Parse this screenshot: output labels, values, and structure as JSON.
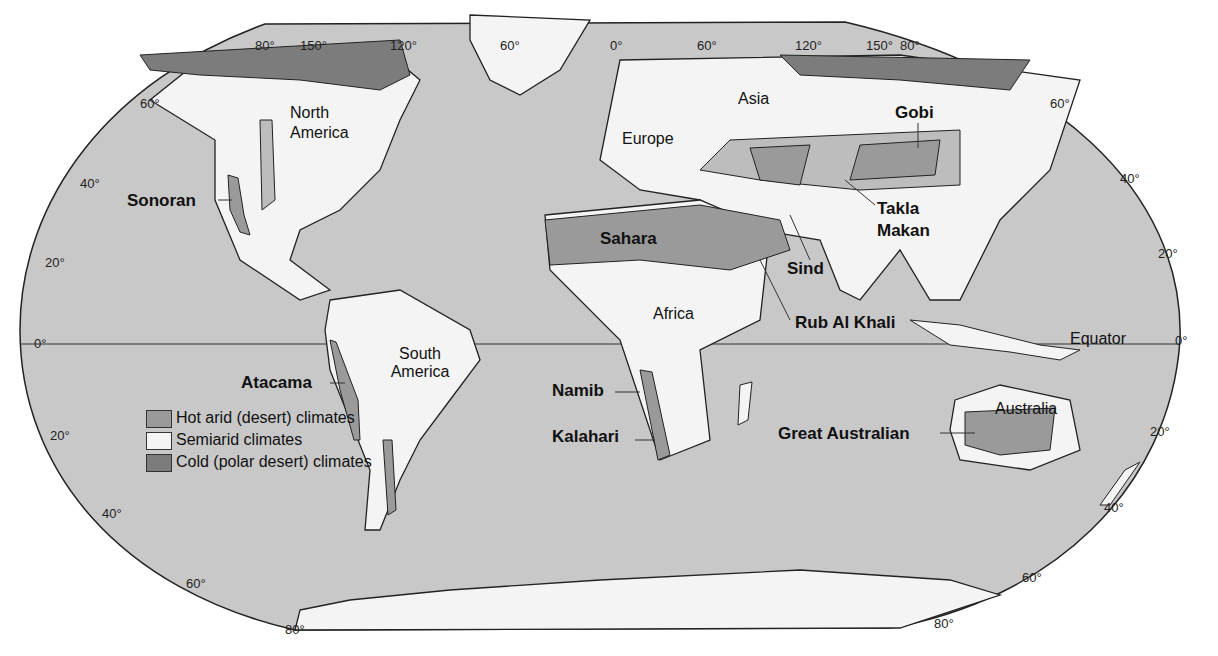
{
  "colors": {
    "ocean": "#c8c8c8",
    "land_semiarid": "#f4f4f4",
    "land_other": "#bdbdbd",
    "hot_arid": "#9a9a9a",
    "cold_polar": "#7c7c7c",
    "outline": "#222222"
  },
  "legend": {
    "items": [
      {
        "label": "Hot arid (desert) climates",
        "color": "#9a9a9a"
      },
      {
        "label": "Semiarid climates",
        "color": "#f4f4f4"
      },
      {
        "label": "Cold (polar desert) climates",
        "color": "#7c7c7c"
      }
    ]
  },
  "continents": {
    "north_america": "North America",
    "south_america": "South America",
    "europe": "Europe",
    "asia": "Asia",
    "africa": "Africa",
    "australia": "Australia"
  },
  "deserts": {
    "sonoran": "Sonoran",
    "atacama": "Atacama",
    "sahara": "Sahara",
    "namib": "Namib",
    "kalahari": "Kalahari",
    "gobi": "Gobi",
    "takla_makan_1": "Takla",
    "takla_makan_2": "Makan",
    "sind": "Sind",
    "rub_al_khali": "Rub Al Khali",
    "great_australian": "Great Australian"
  },
  "equator_label": "Equator",
  "graticule": {
    "top_longitudes": [
      "80°",
      "150°",
      "120°",
      "60°",
      "0°",
      "60°",
      "120°",
      "150°",
      "80°"
    ],
    "left_latitudes": [
      "60°",
      "40°",
      "20°",
      "0°",
      "20°",
      "40°",
      "60°",
      "80°"
    ],
    "right_latitudes": [
      "60°",
      "40°",
      "20°",
      "0°",
      "20°",
      "40°",
      "60°",
      "80°"
    ]
  }
}
